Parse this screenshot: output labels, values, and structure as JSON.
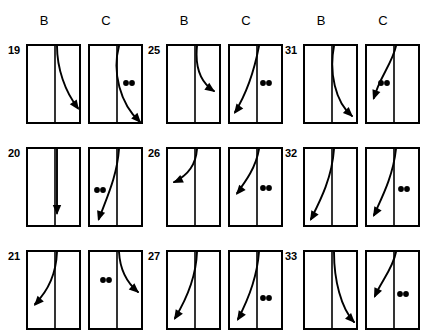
{
  "figure": {
    "background_color": "#ffffff",
    "ink_color": "#000000",
    "column_headers": [
      "B",
      "C",
      "B",
      "C",
      "B",
      "C"
    ],
    "row_numbers": [
      "19",
      "20",
      "21",
      "25",
      "26",
      "27",
      "31",
      "32",
      "33"
    ],
    "panel_count": 18,
    "panels": [
      {
        "id": "19-B",
        "row_label": "19",
        "column_label": "B",
        "x": 26,
        "y": 44,
        "w": 55,
        "h": 80,
        "divider_x": 0.52,
        "curve": "M 29,0 C 29,22 37,46 50,62",
        "arrow_x": 51,
        "arrow_y": 64,
        "arrow_angle": 55,
        "dots": []
      },
      {
        "id": "19-C",
        "row_label": "19",
        "column_label": "C",
        "x": 88,
        "y": 44,
        "w": 55,
        "h": 80,
        "divider_x": 0.52,
        "curve": "M 29,0 C 22,26 30,58 50,76",
        "arrow_x": 51,
        "arrow_y": 77,
        "arrow_angle": 48,
        "dots": [
          {
            "x": 36,
            "y": 37
          },
          {
            "x": 42,
            "y": 37
          }
        ]
      },
      {
        "id": "20-B",
        "row_label": "20",
        "column_label": "B",
        "x": 26,
        "y": 147,
        "w": 55,
        "h": 80,
        "divider_x": 0.52,
        "curve": "M 29,0 L 29,64",
        "arrow_x": 29,
        "arrow_y": 66,
        "arrow_angle": 90,
        "dots": []
      },
      {
        "id": "20-C",
        "row_label": "20",
        "column_label": "C",
        "x": 88,
        "y": 147,
        "w": 55,
        "h": 80,
        "divider_x": 0.52,
        "curve": "M 29,0 C 27,28 16,50 9,70",
        "arrow_x": 8,
        "arrow_y": 72,
        "arrow_angle": 108,
        "dots": [
          {
            "x": 7,
            "y": 41
          },
          {
            "x": 13,
            "y": 41
          }
        ]
      },
      {
        "id": "21-B",
        "row_label": "21",
        "column_label": "B",
        "x": 26,
        "y": 250,
        "w": 55,
        "h": 80,
        "divider_x": 0.52,
        "curve": "M 29,0 C 28,24 19,40 7,52",
        "arrow_x": 6,
        "arrow_y": 54,
        "arrow_angle": 132,
        "dots": []
      },
      {
        "id": "21-C",
        "row_label": "21",
        "column_label": "C",
        "x": 88,
        "y": 250,
        "w": 55,
        "h": 80,
        "divider_x": 0.52,
        "curve": "M 29,0 C 30,18 36,30 48,40",
        "arrow_x": 49,
        "arrow_y": 41,
        "arrow_angle": 42,
        "dots": [
          {
            "x": 13,
            "y": 28
          },
          {
            "x": 19,
            "y": 28
          }
        ]
      },
      {
        "id": "25-B",
        "row_label": "25",
        "column_label": "B",
        "x": 166,
        "y": 44,
        "w": 55,
        "h": 80,
        "divider_x": 0.52,
        "curve": "M 29,0 C 27,20 32,36 46,45",
        "arrow_x": 47,
        "arrow_y": 46,
        "arrow_angle": 35,
        "dots": []
      },
      {
        "id": "25-C",
        "row_label": "25",
        "column_label": "C",
        "x": 228,
        "y": 44,
        "w": 55,
        "h": 80,
        "divider_x": 0.52,
        "curve": "M 29,0 C 24,26 15,50 5,66",
        "arrow_x": 4,
        "arrow_y": 68,
        "arrow_angle": 126,
        "dots": [
          {
            "x": 33,
            "y": 37
          },
          {
            "x": 39,
            "y": 37
          }
        ]
      },
      {
        "id": "26-B",
        "row_label": "26",
        "column_label": "B",
        "x": 166,
        "y": 147,
        "w": 55,
        "h": 80,
        "divider_x": 0.52,
        "curve": "M 29,0 C 28,14 21,26 6,33",
        "arrow_x": 5,
        "arrow_y": 34,
        "arrow_angle": 155,
        "dots": []
      },
      {
        "id": "26-C",
        "row_label": "26",
        "column_label": "C",
        "x": 228,
        "y": 147,
        "w": 55,
        "h": 80,
        "divider_x": 0.52,
        "curve": "M 29,0 C 26,18 16,32 7,44",
        "arrow_x": 6,
        "arrow_y": 46,
        "arrow_angle": 130,
        "dots": [
          {
            "x": 33,
            "y": 39
          },
          {
            "x": 39,
            "y": 39
          }
        ]
      },
      {
        "id": "27-B",
        "row_label": "27",
        "column_label": "B",
        "x": 166,
        "y": 250,
        "w": 55,
        "h": 80,
        "divider_x": 0.52,
        "curve": "M 29,0 C 28,26 18,48 7,66",
        "arrow_x": 6,
        "arrow_y": 68,
        "arrow_angle": 122,
        "dots": []
      },
      {
        "id": "27-C",
        "row_label": "27",
        "column_label": "C",
        "x": 228,
        "y": 250,
        "w": 55,
        "h": 80,
        "divider_x": 0.52,
        "curve": "M 29,0 C 27,26 17,50 8,67",
        "arrow_x": 7,
        "arrow_y": 69,
        "arrow_angle": 122,
        "dots": [
          {
            "x": 33,
            "y": 46
          },
          {
            "x": 39,
            "y": 46
          }
        ]
      },
      {
        "id": "31-B",
        "row_label": "31",
        "column_label": "B",
        "x": 303,
        "y": 44,
        "w": 55,
        "h": 80,
        "divider_x": 0.52,
        "curve": "M 29,0 C 24,26 30,56 47,70",
        "arrow_x": 48,
        "arrow_y": 71,
        "arrow_angle": 44,
        "dots": []
      },
      {
        "id": "31-C",
        "row_label": "31",
        "column_label": "C",
        "x": 365,
        "y": 44,
        "w": 55,
        "h": 80,
        "divider_x": 0.52,
        "curve": "M 29,0 C 25,18 12,32 7,52",
        "arrow_x": 6,
        "arrow_y": 54,
        "arrow_angle": 110,
        "dots": [
          {
            "x": 14,
            "y": 37
          },
          {
            "x": 20,
            "y": 37
          }
        ]
      },
      {
        "id": "32-B",
        "row_label": "32",
        "column_label": "B",
        "x": 303,
        "y": 147,
        "w": 55,
        "h": 80,
        "divider_x": 0.52,
        "curve": "M 29,0 C 27,30 14,54 6,70",
        "arrow_x": 5,
        "arrow_y": 72,
        "arrow_angle": 120,
        "dots": []
      },
      {
        "id": "32-C",
        "row_label": "32",
        "column_label": "C",
        "x": 365,
        "y": 147,
        "w": 55,
        "h": 80,
        "divider_x": 0.52,
        "curve": "M 29,0 C 26,28 14,50 7,66",
        "arrow_x": 6,
        "arrow_y": 68,
        "arrow_angle": 120,
        "dots": [
          {
            "x": 34,
            "y": 40
          },
          {
            "x": 40,
            "y": 40
          }
        ]
      },
      {
        "id": "33-B",
        "row_label": "33",
        "column_label": "B",
        "x": 303,
        "y": 250,
        "w": 55,
        "h": 80,
        "divider_x": 0.52,
        "curve": "M 29,0 C 29,28 36,56 49,70",
        "arrow_x": 50,
        "arrow_y": 71,
        "arrow_angle": 46,
        "dots": []
      },
      {
        "id": "33-C",
        "row_label": "33",
        "column_label": "C",
        "x": 365,
        "y": 250,
        "w": 55,
        "h": 80,
        "divider_x": 0.52,
        "curve": "M 29,0 C 26,16 14,30 8,44",
        "arrow_x": 7,
        "arrow_y": 46,
        "arrow_angle": 115,
        "dots": [
          {
            "x": 33,
            "y": 42
          },
          {
            "x": 39,
            "y": 42
          }
        ]
      }
    ],
    "header_positions": [
      {
        "label": "B",
        "x": 44,
        "y": 14
      },
      {
        "label": "C",
        "x": 106,
        "y": 14
      },
      {
        "label": "B",
        "x": 184,
        "y": 14
      },
      {
        "label": "C",
        "x": 246,
        "y": 14
      },
      {
        "label": "B",
        "x": 321,
        "y": 14
      },
      {
        "label": "C",
        "x": 383,
        "y": 14
      }
    ],
    "row_label_positions": [
      {
        "label": "19",
        "x": 8,
        "y": 44
      },
      {
        "label": "20",
        "x": 8,
        "y": 147
      },
      {
        "label": "21",
        "x": 8,
        "y": 250
      },
      {
        "label": "25",
        "x": 148,
        "y": 44
      },
      {
        "label": "26",
        "x": 148,
        "y": 147
      },
      {
        "label": "27",
        "x": 148,
        "y": 250
      },
      {
        "label": "31",
        "x": 285,
        "y": 44
      },
      {
        "label": "32",
        "x": 285,
        "y": 147
      },
      {
        "label": "33",
        "x": 285,
        "y": 250
      }
    ]
  }
}
